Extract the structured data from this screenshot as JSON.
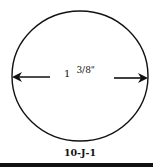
{
  "diagram": {
    "shape": "circle",
    "dimension": {
      "whole": "1",
      "fraction": "3/8\"",
      "full_text": "1 3/8\""
    },
    "figure_label": "10-J-1",
    "colors": {
      "stroke": "#111111",
      "background": "#ffffff"
    }
  }
}
